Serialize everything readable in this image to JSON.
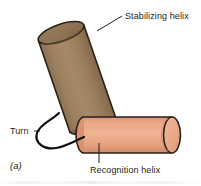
{
  "figure": {
    "panel_letter": "(a)",
    "background_color": "#ffffff",
    "labels": {
      "stabilizing_helix": "Stabilizing helix",
      "recognition_helix": "Recognition helix",
      "turn": "Turn"
    },
    "shapes": {
      "stabilizing_helix_cylinder": {
        "name": "stabilizing-helix-cylinder",
        "body_color": "#9d8160",
        "cap_color": "#8d7252",
        "shade_color": "#8a6e4e",
        "outline_color": "#2b2118",
        "orientation": "tilted",
        "tilt_degrees": -20
      },
      "recognition_helix_cylinder": {
        "name": "recognition-helix-cylinder",
        "body_color": "#e8a383",
        "cap_color": "#efb79d",
        "shade_color": "#d9906f",
        "outline_color": "#2b2118",
        "orientation": "horizontal",
        "tilt_degrees": 0
      },
      "turn_loop": {
        "name": "turn-loop",
        "stroke_color": "#111111",
        "stroke_width": 2
      },
      "leader_lines": {
        "stroke_color": "#231f20",
        "stroke_width": 1
      }
    }
  }
}
